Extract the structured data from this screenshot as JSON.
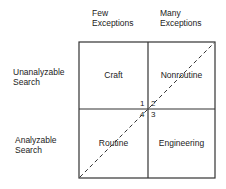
{
  "columns": [
    {
      "line1": "Few",
      "line2": "Exceptions"
    },
    {
      "line1": "Many",
      "line2": "Exceptions"
    }
  ],
  "rows": [
    {
      "line1": "Unanalyzable",
      "line2": "Search"
    },
    {
      "line1": "Analyzable",
      "line2": "Search"
    }
  ],
  "cells": {
    "top_left": "Craft",
    "top_right": "Nonroutine",
    "bottom_left": "Routine",
    "bottom_right": "Engineering"
  },
  "quadrant_numbers": [
    "1",
    "2",
    "3",
    "4"
  ],
  "diagonal": "dashed line from bottom-left to top-right"
}
